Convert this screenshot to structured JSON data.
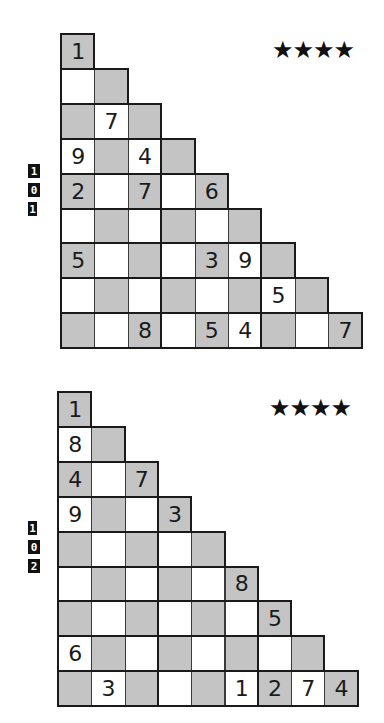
{
  "accent_colors": {
    "shaded_cell": "#c4c4c4",
    "plain_cell": "#ffffff",
    "border": "#3a3a3a",
    "digit": "#1a1a1a"
  },
  "puzzles": [
    {
      "number_label": [
        "1",
        "0",
        "1"
      ],
      "difficulty": "★★★★",
      "difficulty_stars": 4,
      "rows": [
        [
          {
            "s": "g",
            "v": "1"
          }
        ],
        [
          {
            "s": "w",
            "v": ""
          },
          {
            "s": "g",
            "v": ""
          }
        ],
        [
          {
            "s": "g",
            "v": ""
          },
          {
            "s": "w",
            "v": "7"
          },
          {
            "s": "g",
            "v": ""
          }
        ],
        [
          {
            "s": "w",
            "v": "9"
          },
          {
            "s": "g",
            "v": ""
          },
          {
            "s": "w",
            "v": "4"
          },
          {
            "s": "g",
            "v": ""
          }
        ],
        [
          {
            "s": "g",
            "v": "2"
          },
          {
            "s": "w",
            "v": ""
          },
          {
            "s": "g",
            "v": "7"
          },
          {
            "s": "w",
            "v": ""
          },
          {
            "s": "g",
            "v": "6"
          }
        ],
        [
          {
            "s": "w",
            "v": ""
          },
          {
            "s": "g",
            "v": ""
          },
          {
            "s": "w",
            "v": ""
          },
          {
            "s": "g",
            "v": ""
          },
          {
            "s": "w",
            "v": ""
          },
          {
            "s": "g",
            "v": ""
          }
        ],
        [
          {
            "s": "g",
            "v": "5"
          },
          {
            "s": "w",
            "v": ""
          },
          {
            "s": "g",
            "v": ""
          },
          {
            "s": "w",
            "v": ""
          },
          {
            "s": "g",
            "v": "3"
          },
          {
            "s": "w",
            "v": "9"
          },
          {
            "s": "g",
            "v": ""
          }
        ],
        [
          {
            "s": "w",
            "v": ""
          },
          {
            "s": "g",
            "v": ""
          },
          {
            "s": "w",
            "v": ""
          },
          {
            "s": "g",
            "v": ""
          },
          {
            "s": "w",
            "v": ""
          },
          {
            "s": "g",
            "v": ""
          },
          {
            "s": "w",
            "v": "5"
          },
          {
            "s": "g",
            "v": ""
          }
        ],
        [
          {
            "s": "g",
            "v": ""
          },
          {
            "s": "w",
            "v": ""
          },
          {
            "s": "g",
            "v": "8"
          },
          {
            "s": "w",
            "v": ""
          },
          {
            "s": "g",
            "v": "5"
          },
          {
            "s": "w",
            "v": "4"
          },
          {
            "s": "g",
            "v": ""
          },
          {
            "s": "w",
            "v": ""
          },
          {
            "s": "g",
            "v": "7"
          }
        ]
      ]
    },
    {
      "number_label": [
        "1",
        "0",
        "2"
      ],
      "difficulty": "★★★★",
      "difficulty_stars": 4,
      "rows": [
        [
          {
            "s": "g",
            "v": "1"
          }
        ],
        [
          {
            "s": "w",
            "v": "8"
          },
          {
            "s": "g",
            "v": ""
          }
        ],
        [
          {
            "s": "g",
            "v": "4"
          },
          {
            "s": "w",
            "v": ""
          },
          {
            "s": "g",
            "v": "7"
          }
        ],
        [
          {
            "s": "w",
            "v": "9"
          },
          {
            "s": "g",
            "v": ""
          },
          {
            "s": "w",
            "v": ""
          },
          {
            "s": "g",
            "v": "3"
          }
        ],
        [
          {
            "s": "g",
            "v": ""
          },
          {
            "s": "w",
            "v": ""
          },
          {
            "s": "g",
            "v": ""
          },
          {
            "s": "w",
            "v": ""
          },
          {
            "s": "g",
            "v": ""
          }
        ],
        [
          {
            "s": "w",
            "v": ""
          },
          {
            "s": "g",
            "v": ""
          },
          {
            "s": "w",
            "v": ""
          },
          {
            "s": "g",
            "v": ""
          },
          {
            "s": "w",
            "v": ""
          },
          {
            "s": "g",
            "v": "8"
          }
        ],
        [
          {
            "s": "g",
            "v": ""
          },
          {
            "s": "w",
            "v": ""
          },
          {
            "s": "g",
            "v": ""
          },
          {
            "s": "w",
            "v": ""
          },
          {
            "s": "g",
            "v": ""
          },
          {
            "s": "w",
            "v": ""
          },
          {
            "s": "g",
            "v": "5"
          }
        ],
        [
          {
            "s": "w",
            "v": "6"
          },
          {
            "s": "g",
            "v": ""
          },
          {
            "s": "w",
            "v": ""
          },
          {
            "s": "g",
            "v": ""
          },
          {
            "s": "w",
            "v": ""
          },
          {
            "s": "g",
            "v": ""
          },
          {
            "s": "w",
            "v": ""
          },
          {
            "s": "g",
            "v": ""
          }
        ],
        [
          {
            "s": "g",
            "v": ""
          },
          {
            "s": "w",
            "v": "3"
          },
          {
            "s": "g",
            "v": ""
          },
          {
            "s": "w",
            "v": ""
          },
          {
            "s": "g",
            "v": ""
          },
          {
            "s": "w",
            "v": "1"
          },
          {
            "s": "g",
            "v": "2"
          },
          {
            "s": "w",
            "v": "7"
          },
          {
            "s": "g",
            "v": "4"
          }
        ]
      ]
    }
  ]
}
